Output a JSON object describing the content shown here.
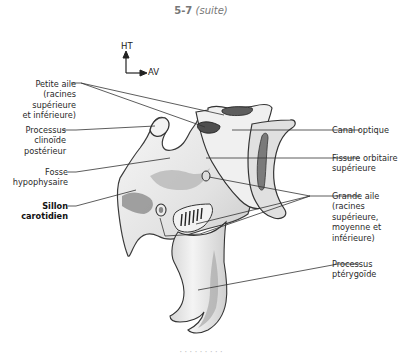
{
  "figure": {
    "number": "5-7",
    "suffix": "(suite)",
    "caption_partial": "· · · · · · · · ·"
  },
  "orientation": {
    "up_label": "HT",
    "forward_label": "AV"
  },
  "labels_left": [
    {
      "id": "petite-aile",
      "lines": [
        "Petite aile",
        "(racines",
        "supérieure",
        "et inférieure)"
      ],
      "bold": false
    },
    {
      "id": "processus-clinoide",
      "lines": [
        "Processus",
        "clinoïde",
        "postérieur"
      ],
      "bold": false
    },
    {
      "id": "fosse-hypophysaire",
      "lines": [
        "Fosse",
        "hypophysaire"
      ],
      "bold": false
    },
    {
      "id": "sillon-carotidien",
      "lines": [
        "Sillon",
        "carotidien"
      ],
      "bold": true
    }
  ],
  "labels_right": [
    {
      "id": "canal-optique",
      "lines": [
        "Canal optique"
      ],
      "bold": false
    },
    {
      "id": "fissure-orbitaire",
      "lines": [
        "Fissure orbitaire",
        "supérieure"
      ],
      "bold": false
    },
    {
      "id": "grande-aile",
      "lines": [
        "Grande aile",
        "(racines",
        "supérieure,",
        "moyenne et",
        "inférieure)"
      ],
      "bold": false
    },
    {
      "id": "processus-pterygoide",
      "lines": [
        "Processus",
        "ptérygoïde"
      ],
      "bold": false
    }
  ],
  "colors": {
    "leader_line": "#333333",
    "bone_fill": "#ececec",
    "bone_outline": "#3a3a3a",
    "shade": "#9a9a9a"
  }
}
